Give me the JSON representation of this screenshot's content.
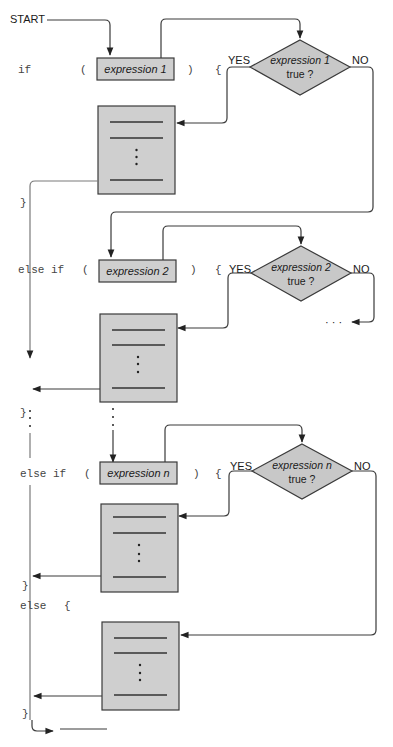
{
  "diagram": {
    "start_label": "START",
    "branches": [
      {
        "keyword": "if",
        "open_paren": "(",
        "close_paren": ")",
        "open_brace": "{",
        "close_brace": "}",
        "expression": "expression 1",
        "condition_line1": "expression 1",
        "condition_line2": "true ?",
        "yes_label": "YES",
        "no_label": "NO"
      },
      {
        "keyword": "else if",
        "open_paren": "(",
        "close_paren": ")",
        "open_brace": "{",
        "close_brace": "}",
        "expression": "expression 2",
        "condition_line1": "expression 2",
        "condition_line2": "true ?",
        "yes_label": "YES",
        "no_label": "NO",
        "continuation": "· · ·"
      },
      {
        "keyword": "else if",
        "open_paren": "(",
        "close_paren": ")",
        "open_brace": "{",
        "close_brace": "}",
        "expression": "expression n",
        "condition_line1": "expression n",
        "condition_line2": "true ?",
        "yes_label": "YES",
        "no_label": "NO"
      }
    ],
    "else_branch": {
      "keyword": "else",
      "open_brace": "{",
      "close_brace": "}"
    },
    "colors": {
      "box_fill": "#cfcfcf",
      "diamond_fill": "#c8c8c8",
      "stroke": "#3a3a3a",
      "code_text": "#444444"
    }
  }
}
